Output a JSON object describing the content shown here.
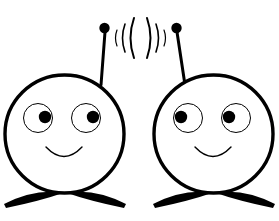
{
  "canvas": {
    "width": 279,
    "height": 221,
    "background": "#ffffff",
    "ink": "#000000",
    "description": "Line-art clip art of two round-headed cartoon robot characters with antennas exchanging radio waves"
  },
  "style": {
    "head_stroke_width": 3.4,
    "eye_stroke_width": 1.0,
    "mouth_stroke_width": 1.4,
    "antenna_stroke_width": 3.0,
    "wave_stroke_width": 1.6
  },
  "characters": [
    {
      "id": "left-robot",
      "label": "Left robot character",
      "head": {
        "cx": 64.5,
        "cy": 134,
        "rx": 59.5,
        "ry": 59,
        "fill": "#ffffff"
      },
      "eyes": [
        {
          "id": "left-eye",
          "cx": 38,
          "cy": 118,
          "r": 14.5,
          "pupil_cx": 45,
          "pupil_cy": 117,
          "pupil_r": 6.2
        },
        {
          "id": "right-eye",
          "cx": 86,
          "cy": 118,
          "r": 14.5,
          "pupil_cx": 93,
          "pupil_cy": 117,
          "pupil_r": 6.2
        }
      ],
      "mouth": {
        "path": "M 46 147 Q 64 166 82 147",
        "label": "smile"
      },
      "antenna": {
        "line": {
          "x1": 101,
          "y1": 85,
          "x2": 105,
          "y2": 32
        },
        "tip": {
          "cx": 104.5,
          "cy": 28,
          "r": 5.2
        }
      },
      "feet": [
        {
          "id": "left-foot",
          "path": "M 4 204 Q 36 188 63 193 Q 40 201 6 208 Z"
        },
        {
          "id": "right-foot",
          "path": "M 126 204 Q 94 188 67 193 Q 90 201 124 208 Z"
        }
      ]
    },
    {
      "id": "right-robot",
      "label": "Right robot character",
      "head": {
        "cx": 213.5,
        "cy": 134,
        "rx": 59.5,
        "ry": 59,
        "fill": "#ffffff"
      },
      "eyes": [
        {
          "id": "left-eye",
          "cx": 188,
          "cy": 118,
          "r": 14.5,
          "pupil_cx": 181,
          "pupil_cy": 117,
          "pupil_r": 6.2
        },
        {
          "id": "right-eye",
          "cx": 236,
          "cy": 118,
          "r": 14.5,
          "pupil_cx": 229,
          "pupil_cy": 117,
          "pupil_r": 6.2
        }
      ],
      "mouth": {
        "path": "M 195 147 Q 213 166 231 147",
        "label": "smile"
      },
      "antenna": {
        "line": {
          "x1": 185,
          "y1": 85,
          "x2": 177,
          "y2": 32
        },
        "tip": {
          "cx": 176.5,
          "cy": 28,
          "r": 5.2
        }
      },
      "feet": [
        {
          "id": "left-foot",
          "path": "M 153 204 Q 185 188 212 193 Q 189 201 155 208 Z"
        },
        {
          "id": "right-foot",
          "path": "M 275 204 Q 243 188 216 193 Q 239 201 273 208 Z"
        }
      ]
    }
  ],
  "signal_waves": {
    "label": "radio transmission arcs between antennas",
    "left_group": [
      {
        "path": "M 117 30 Q 114 38 117 46",
        "width": 1.2
      },
      {
        "path": "M 125 24 Q 120 38 125 52",
        "width": 1.6
      },
      {
        "path": "M 134 18 Q 127 38 134 58",
        "width": 2.0
      }
    ],
    "right_group": [
      {
        "path": "M 147 18 Q 154 38 147 58",
        "width": 2.0
      },
      {
        "path": "M 156 24 Q 161 38 156 52",
        "width": 1.6
      },
      {
        "path": "M 164 30 Q 167 38 164 46",
        "width": 1.2
      }
    ]
  }
}
